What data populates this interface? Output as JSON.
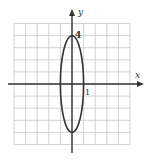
{
  "chart_data": {
    "type": "line",
    "title": "",
    "xlabel": "x",
    "ylabel": "y",
    "xlim": [
      -5,
      5
    ],
    "ylim": [
      -5,
      5
    ],
    "grid": true,
    "grid_step": 1,
    "tick_labels": {
      "x": [
        {
          "value": 1,
          "label": "1"
        }
      ],
      "y": [
        {
          "value": 4,
          "label": "4"
        }
      ]
    },
    "series": [
      {
        "name": "ellipse",
        "equation": "x^2 + y^2/16 = 1",
        "center": [
          0,
          0
        ],
        "semi_axis_x": 1,
        "semi_axis_y": 4,
        "points": [
          [
            0,
            4
          ],
          [
            0.5,
            3.46
          ],
          [
            0.87,
            2
          ],
          [
            1,
            0
          ],
          [
            0.87,
            -2
          ],
          [
            0.5,
            -3.46
          ],
          [
            0,
            -4
          ],
          [
            -0.5,
            -3.46
          ],
          [
            -0.87,
            -2
          ],
          [
            -1,
            0
          ],
          [
            -0.87,
            2
          ],
          [
            -0.5,
            3.46
          ],
          [
            0,
            4
          ]
        ]
      }
    ],
    "legend": null
  },
  "labels": {
    "x_axis": "x",
    "y_axis": "y",
    "x_tick": "1",
    "y_tick": "4"
  },
  "colors": {
    "grid": "#c8c8c8",
    "axis": "#333333",
    "curve": "#333333"
  }
}
